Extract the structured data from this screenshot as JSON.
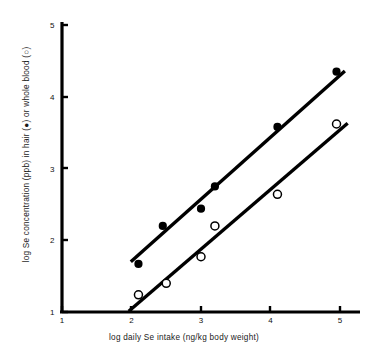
{
  "chart_data": {
    "type": "scatter",
    "title": "",
    "xlabel": "log daily Se intake (ng/kg body weight)",
    "ylabel": "log Se concentration (ppb) in hair (●) or whole blood (○)",
    "xlim": [
      1,
      5
    ],
    "ylim": [
      1,
      5
    ],
    "xticks": [
      "1",
      "2",
      "3",
      "4",
      "5"
    ],
    "yticks": [
      "1",
      "2",
      "3",
      "4",
      "5"
    ],
    "grid": false,
    "legend_position": "in-axis-label",
    "series": [
      {
        "name": "hair",
        "marker": "filled-circle",
        "symbol": "●",
        "color": "#000000",
        "points": [
          {
            "x": 2.1,
            "y": 1.67
          },
          {
            "x": 2.45,
            "y": 2.2
          },
          {
            "x": 3.0,
            "y": 2.44
          },
          {
            "x": 3.2,
            "y": 2.75
          },
          {
            "x": 4.1,
            "y": 3.58
          },
          {
            "x": 4.95,
            "y": 4.35
          }
        ],
        "fit_line": {
          "x0": 1.99,
          "y0": 1.7,
          "x1": 5.07,
          "y1": 4.36
        }
      },
      {
        "name": "whole blood",
        "marker": "open-circle",
        "symbol": "○",
        "color": "#000000",
        "points": [
          {
            "x": 2.1,
            "y": 1.24
          },
          {
            "x": 2.5,
            "y": 1.4
          },
          {
            "x": 3.0,
            "y": 1.77
          },
          {
            "x": 3.2,
            "y": 2.2
          },
          {
            "x": 4.1,
            "y": 2.64
          },
          {
            "x": 4.95,
            "y": 3.62
          }
        ],
        "fit_line": {
          "x0": 1.96,
          "y0": 1.01,
          "x1": 5.11,
          "y1": 3.63
        }
      }
    ]
  }
}
